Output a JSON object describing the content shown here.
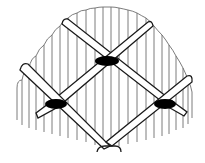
{
  "figure": {
    "colors": {
      "background": "#ffffff",
      "line": "#1a1a1a",
      "fringe": "#6e6e6e",
      "knot": "#000000"
    },
    "knots": [
      {
        "name": "top-knot",
        "cx": 107,
        "cy": 61
      },
      {
        "name": "left-knot",
        "cx": 55,
        "cy": 104
      },
      {
        "name": "right-knot",
        "cx": 165,
        "cy": 104
      }
    ]
  }
}
